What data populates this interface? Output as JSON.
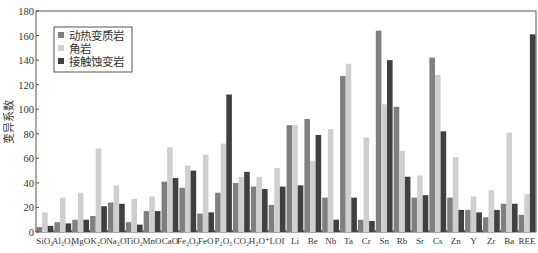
{
  "chart_data": {
    "type": "bar",
    "title": "",
    "xlabel": "",
    "ylabel": "变异系数",
    "ylim": [
      0,
      180
    ],
    "yticks": [
      0,
      20,
      40,
      60,
      80,
      100,
      120,
      140,
      160,
      180
    ],
    "grid": false,
    "legend_position": "upper-left",
    "categories": [
      "SiO₂",
      "Al₂O₃",
      "MgO",
      "K₂O",
      "Na₂O",
      "TiO₂",
      "MnO",
      "CaO",
      "Fe₂O₃",
      "FeO",
      "P₂O₅",
      "CO₂",
      "H₂O⁺",
      "LOI",
      "Li",
      "Be",
      "Nb",
      "Ta",
      "Cr",
      "Sn",
      "Rb",
      "Sr",
      "Cs",
      "Zn",
      "Y",
      "Zr",
      "Ba",
      "REE"
    ],
    "series": [
      {
        "name": "动热变质岩",
        "color": "#7f7f7f",
        "values": [
          4,
          8,
          10,
          13,
          24,
          8,
          17,
          41,
          36,
          15,
          32,
          40,
          37,
          22,
          87,
          92,
          28,
          127,
          10,
          164,
          102,
          28,
          142,
          28,
          18,
          12,
          23,
          14
        ]
      },
      {
        "name": "角岩",
        "color": "#cfcfcf",
        "values": [
          16,
          28,
          32,
          68,
          38,
          27,
          29,
          69,
          54,
          63,
          72,
          45,
          45,
          52,
          87,
          58,
          84,
          137,
          77,
          104,
          66,
          46,
          128,
          61,
          29,
          34,
          81,
          31
        ]
      },
      {
        "name": "接触蚀变岩",
        "color": "#404040",
        "values": [
          5,
          7,
          10,
          21,
          23,
          6,
          17,
          44,
          50,
          16,
          112,
          49,
          35,
          37,
          38,
          79,
          10,
          28,
          9,
          140,
          45,
          30,
          82,
          18,
          16,
          18,
          23,
          161
        ]
      }
    ]
  }
}
